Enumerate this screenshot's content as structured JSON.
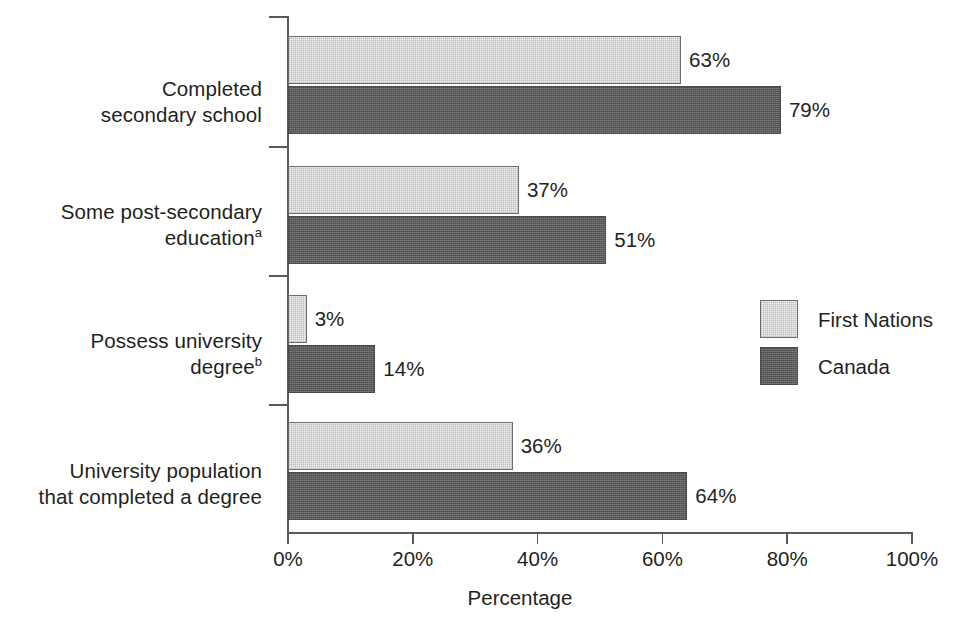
{
  "chart_data": {
    "type": "bar",
    "orientation": "horizontal",
    "title": "",
    "xlabel": "Percentage",
    "ylabel": "",
    "xlim": [
      0,
      100
    ],
    "xticks": [
      "0%",
      "20%",
      "40%",
      "60%",
      "80%",
      "100%"
    ],
    "xtick_values": [
      0,
      20,
      40,
      60,
      80,
      100
    ],
    "grid": false,
    "legend_position": "right-middle",
    "categories": [
      "Completed\nsecondary school",
      "Some post-secondary\neducation",
      "Possess university\ndegree",
      "University population\nthat completed a degree"
    ],
    "category_footnotes": [
      "",
      "a",
      "b",
      ""
    ],
    "series": [
      {
        "name": "First Nations",
        "color": "#f1f1f1",
        "values": [
          63,
          37,
          3,
          36
        ],
        "labels": [
          "63%",
          "37%",
          "3%",
          "36%"
        ]
      },
      {
        "name": "Canada",
        "color": "#5b5b5b",
        "values": [
          79,
          51,
          14,
          64
        ],
        "labels": [
          "79%",
          "51%",
          "14%",
          "64%"
        ]
      }
    ]
  },
  "legend": {
    "items": [
      {
        "label": "First Nations",
        "swatch": "light"
      },
      {
        "label": "Canada",
        "swatch": "dark"
      }
    ]
  },
  "axis": {
    "x_title": "Percentage"
  }
}
